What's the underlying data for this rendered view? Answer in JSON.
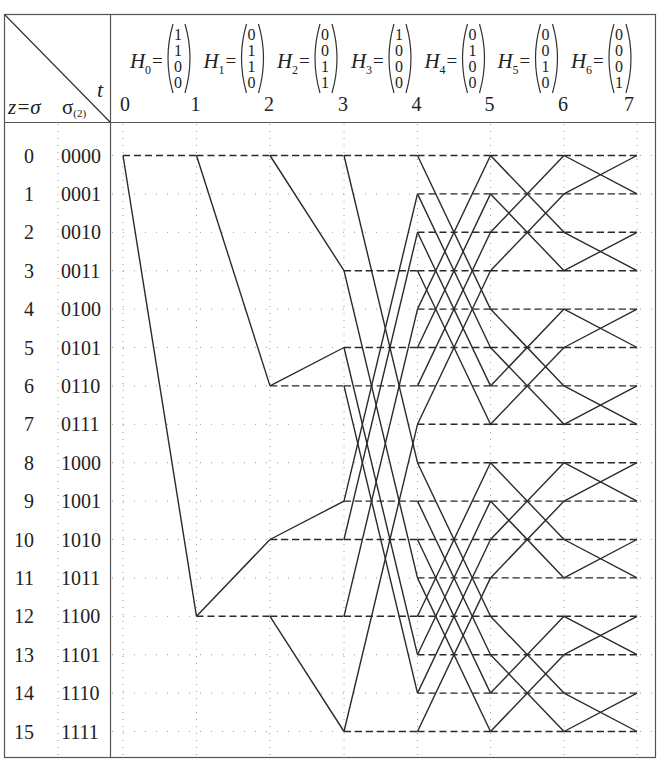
{
  "header": {
    "corner_row_label": "z=σ",
    "corner_binary_label": "σ",
    "corner_binary_subscript": "(2)",
    "corner_time_label": "t"
  },
  "time_steps": [
    "0",
    "1",
    "2",
    "3",
    "4",
    "5",
    "6",
    "7"
  ],
  "matrices": [
    {
      "name": "H",
      "index": "0",
      "values": [
        "1",
        "1",
        "0",
        "0"
      ]
    },
    {
      "name": "H",
      "index": "1",
      "values": [
        "0",
        "1",
        "1",
        "0"
      ]
    },
    {
      "name": "H",
      "index": "2",
      "values": [
        "0",
        "0",
        "1",
        "1"
      ]
    },
    {
      "name": "H",
      "index": "3",
      "values": [
        "1",
        "0",
        "0",
        "0"
      ]
    },
    {
      "name": "H",
      "index": "4",
      "values": [
        "0",
        "1",
        "0",
        "0"
      ]
    },
    {
      "name": "H",
      "index": "5",
      "values": [
        "0",
        "0",
        "1",
        "0"
      ]
    },
    {
      "name": "H",
      "index": "6",
      "values": [
        "0",
        "0",
        "0",
        "1"
      ]
    }
  ],
  "states": [
    {
      "z": "0",
      "binary": "0000"
    },
    {
      "z": "1",
      "binary": "0001"
    },
    {
      "z": "2",
      "binary": "0010"
    },
    {
      "z": "3",
      "binary": "0011"
    },
    {
      "z": "4",
      "binary": "0100"
    },
    {
      "z": "5",
      "binary": "0101"
    },
    {
      "z": "6",
      "binary": "0110"
    },
    {
      "z": "7",
      "binary": "0111"
    },
    {
      "z": "8",
      "binary": "1000"
    },
    {
      "z": "9",
      "binary": "1001"
    },
    {
      "z": "10",
      "binary": "1010"
    },
    {
      "z": "11",
      "binary": "1011"
    },
    {
      "z": "12",
      "binary": "1100"
    },
    {
      "z": "13",
      "binary": "1101"
    },
    {
      "z": "14",
      "binary": "1110"
    },
    {
      "z": "15",
      "binary": "1111"
    }
  ],
  "trellis": {
    "active_nodes": [
      [
        0
      ],
      [
        0,
        12
      ],
      [
        0,
        6,
        10,
        12
      ],
      [
        0,
        3,
        5,
        6,
        9,
        10,
        12,
        15
      ],
      [
        0,
        1,
        2,
        3,
        4,
        5,
        6,
        7,
        8,
        9,
        10,
        11,
        12,
        13,
        14,
        15
      ],
      [
        0,
        1,
        2,
        3,
        4,
        5,
        6,
        7,
        8,
        9,
        10,
        11,
        12,
        13,
        14,
        15
      ],
      [
        0,
        1,
        2,
        3,
        4,
        5,
        6,
        7,
        8,
        9,
        10,
        11,
        12,
        13,
        14,
        15
      ],
      [
        0,
        1,
        2,
        3,
        4,
        5,
        6,
        7,
        8,
        9,
        10,
        11,
        12,
        13,
        14,
        15
      ]
    ],
    "h_masks": [
      12,
      6,
      3,
      8,
      4,
      2,
      1
    ],
    "edge_rule": "dashed edge z->z (bit 0), solid edge z->z XOR H_t (bit 1)"
  },
  "colors": {
    "line": "#2a2a2a",
    "grid_dots": "#9a9a9a",
    "border": "#555555"
  }
}
